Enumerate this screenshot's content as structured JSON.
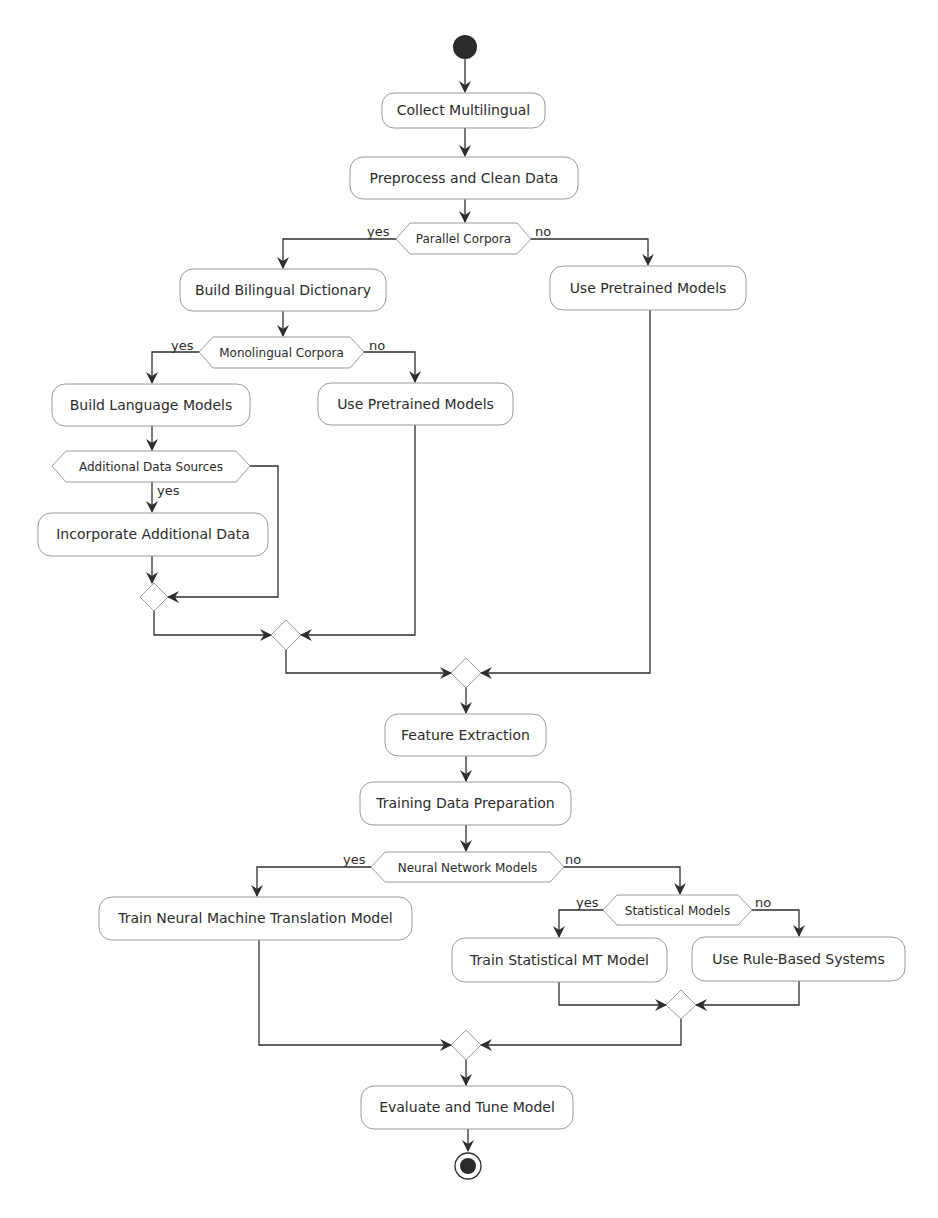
{
  "diagram": {
    "type": "activity",
    "colors": {
      "line": "#2e2e2e",
      "border": "#9a9a9a",
      "fill": "#ffffff",
      "start": "#2b2b2b",
      "text": "#2b2b2b"
    },
    "start": {
      "label": "start"
    },
    "end": {
      "label": "end"
    },
    "actions": {
      "collect": "Collect Multilingual",
      "preprocess": "Preprocess and Clean Data",
      "bilingual": "Build Bilingual Dictionary",
      "pretrained_right": "Use Pretrained Models",
      "language_models": "Build Language Models",
      "pretrained_mid": "Use Pretrained Models",
      "incorporate": "Incorporate Additional Data",
      "feature": "Feature Extraction",
      "training": "Training Data Preparation",
      "train_nmt": "Train Neural Machine Translation Model",
      "train_smt": "Train Statistical MT Model",
      "rule_based": "Use Rule-Based Systems",
      "evaluate": "Evaluate and Tune Model"
    },
    "decisions": {
      "parallel": {
        "label": "Parallel Corpora",
        "yes": "yes",
        "no": "no"
      },
      "monolingual": {
        "label": "Monolingual Corpora",
        "yes": "yes",
        "no": "no"
      },
      "additional": {
        "label": "Additional Data Sources",
        "yes": "yes"
      },
      "neural": {
        "label": "Neural Network Models",
        "yes": "yes",
        "no": "no"
      },
      "statistical": {
        "label": "Statistical Models",
        "yes": "yes",
        "no": "no"
      }
    }
  }
}
